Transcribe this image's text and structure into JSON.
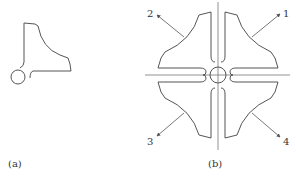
{
  "figure": {
    "subfigures": [
      {
        "id": "a",
        "caption": "(a)",
        "description": "single quadrant piece with small circle"
      },
      {
        "id": "b",
        "caption": "(b)",
        "description": "four quadrant pieces arranged around central circle with crosshair axes"
      }
    ],
    "callouts": [
      {
        "id": "1",
        "label": "1"
      },
      {
        "id": "2",
        "label": "2"
      },
      {
        "id": "3",
        "label": "3"
      },
      {
        "id": "4",
        "label": "4"
      }
    ],
    "colors": {
      "line": "#555555",
      "axis": "#777777",
      "text": "#333333",
      "background": "#ffffff"
    }
  }
}
